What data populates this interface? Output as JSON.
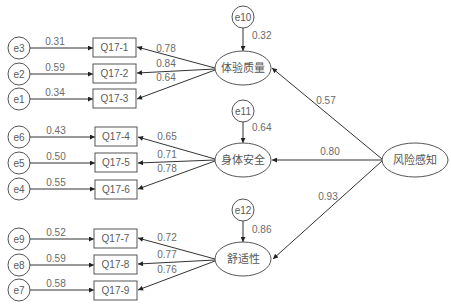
{
  "diagram": {
    "type": "structural-equation-model",
    "exogenous_latent": {
      "id": "risk",
      "label": "风险感知"
    },
    "latent_factors": [
      {
        "id": "f1",
        "label": "体验质量",
        "residual": "e10",
        "residual_value": "0.32",
        "path_from_risk": "0.57",
        "indicators": [
          {
            "label": "Q17-1",
            "error": "e3",
            "error_value": "0.31",
            "loading": "0.78"
          },
          {
            "label": "Q17-2",
            "error": "e2",
            "error_value": "0.59",
            "loading": "0.84"
          },
          {
            "label": "Q17-3",
            "error": "e1",
            "error_value": "0.34",
            "loading": "0.64"
          }
        ]
      },
      {
        "id": "f2",
        "label": "身体安全",
        "residual": "e11",
        "residual_value": "0.64",
        "path_from_risk": "0.80",
        "indicators": [
          {
            "label": "Q17-4",
            "error": "e6",
            "error_value": "0.43",
            "loading": "0.65"
          },
          {
            "label": "Q17-5",
            "error": "e5",
            "error_value": "0.50",
            "loading": "0.71"
          },
          {
            "label": "Q17-6",
            "error": "e4",
            "error_value": "0.55",
            "loading": "0.78"
          }
        ]
      },
      {
        "id": "f3",
        "label": "舒适性",
        "residual": "e12",
        "residual_value": "0.86",
        "path_from_risk": "0.93",
        "indicators": [
          {
            "label": "Q17-7",
            "error": "e9",
            "error_value": "0.52",
            "loading": "0.72"
          },
          {
            "label": "Q17-8",
            "error": "e8",
            "error_value": "0.59",
            "loading": "0.77"
          },
          {
            "label": "Q17-9",
            "error": "e7",
            "error_value": "0.58",
            "loading": "0.76"
          }
        ]
      }
    ]
  },
  "colors": {
    "line": "#333333",
    "shape_stroke": "#555555",
    "text": "#6a6a6a",
    "background": "#ffffff"
  }
}
